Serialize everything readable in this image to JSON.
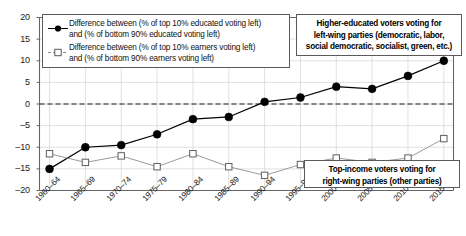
{
  "chart_data": {
    "type": "line",
    "title": "",
    "xlabel": "",
    "ylabel": "",
    "ylim": [
      -20,
      20
    ],
    "ytick_values": [
      20,
      15,
      10,
      5,
      0,
      -5,
      -10,
      -15,
      -20
    ],
    "ytick_labels": [
      "20",
      "15",
      "10",
      "5",
      "0",
      "–5",
      "–10",
      "–15",
      "–20"
    ],
    "grid": true,
    "zero_reference_line": true,
    "legend_position": "top-left",
    "categories": [
      "1960–64",
      "1965–69",
      "1970–74",
      "1975–79",
      "1980–84",
      "1985–89",
      "1990–94",
      "1995–99",
      "2000–04",
      "2005–09",
      "2010–14",
      "2015–20"
    ],
    "series": [
      {
        "name": "Difference between (% of top 10% educated voting left) and (% of bottom 90% educated voting left)",
        "marker": "filled-circle",
        "color": "#000000",
        "values": [
          -15.0,
          -10.0,
          -9.5,
          -7.0,
          -3.5,
          -3.0,
          0.5,
          1.5,
          4.0,
          3.5,
          6.5,
          10.0
        ]
      },
      {
        "name": "Difference between (% of top 10% earners voting left) and (% of bottom 90% earners voting left)",
        "marker": "open-square",
        "color": "#888888",
        "values": [
          -11.5,
          -13.5,
          -12.0,
          -14.5,
          -11.5,
          -14.5,
          -16.5,
          -14.0,
          -12.5,
          -13.5,
          -12.5,
          -8.0
        ]
      }
    ],
    "annotations": [
      {
        "id": "top-right",
        "lines": [
          "Higher-educated voters voting for",
          "left-wing parties (democratic, labor,",
          "social democratic, socialist, green, etc.)"
        ]
      },
      {
        "id": "bottom-right",
        "lines": [
          "Top-income voters voting for",
          "right-wing parties (other parties)"
        ]
      }
    ],
    "legend_entries": [
      {
        "marker": "filled-circle",
        "line1": "Difference between (% of top 10% educated voting left)",
        "line2": "and (% of bottom 90% educated voting left)"
      },
      {
        "marker": "open-square",
        "line1": "Difference between (% of top 10% earners voting left)",
        "line2": "and (% of bottom 90% earners voting left)"
      }
    ]
  }
}
